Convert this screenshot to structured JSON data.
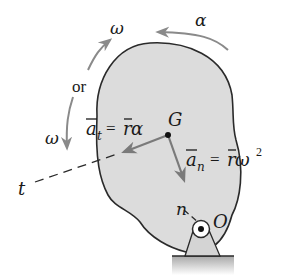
{
  "diagram": {
    "labels": {
      "omega_top": "ω",
      "alpha": "α",
      "or": "or",
      "omega_left": "ω",
      "G": "G",
      "O": "O",
      "t": "t",
      "n": "n",
      "a_t_symbol": "a",
      "a_t_sub": "t",
      "a_t_rhs_r": "r",
      "a_t_rhs_alpha": "α",
      "a_n_symbol": "a",
      "a_n_sub": "n",
      "a_n_rhs_r": "r",
      "a_n_rhs_omega": "ω",
      "a_n_exp": "2",
      "equals": "="
    },
    "equations": {
      "tangential": "a̅t = r̅α",
      "normal": "a̅n = r̅ω²"
    },
    "colors": {
      "body_fill": "#dcdcdc",
      "outline": "#2a2a2a",
      "arrow_gray": "#8a8a8a",
      "ground": "#bdbdbd"
    }
  }
}
